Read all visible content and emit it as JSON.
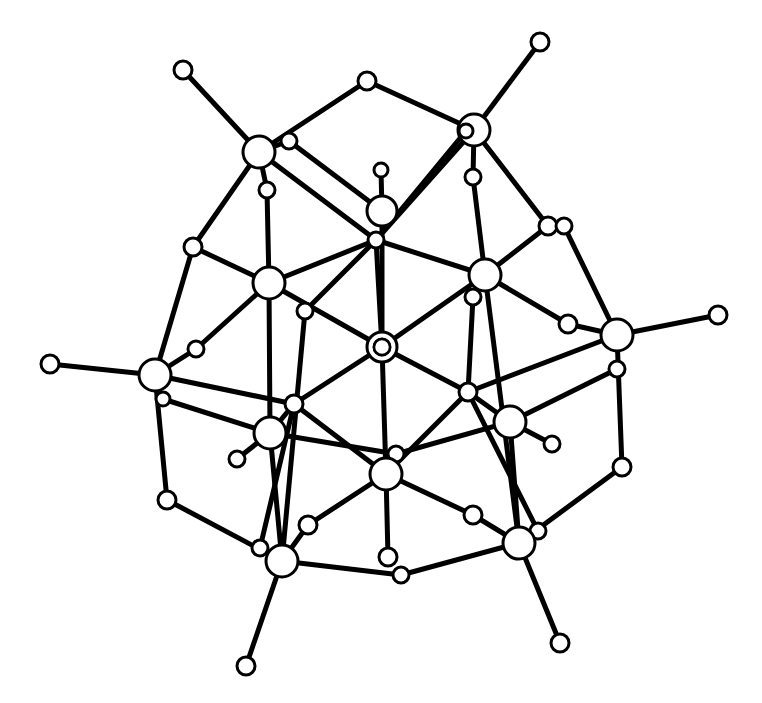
{
  "diagram": {
    "title": "",
    "type": "ball-and-stick molecular cluster",
    "colors": {
      "background": "#ffffff",
      "line": "#000000",
      "atom_fill": "#ffffff"
    },
    "atoms": [
      {
        "id": "a1",
        "x": 183,
        "y": 70,
        "r": 9
      },
      {
        "id": "a2",
        "x": 540,
        "y": 42,
        "r": 9
      },
      {
        "id": "a3",
        "x": 367,
        "y": 81,
        "r": 9
      },
      {
        "id": "a4",
        "x": 259,
        "y": 152,
        "r": 16
      },
      {
        "id": "a5",
        "x": 289,
        "y": 141,
        "r": 8
      },
      {
        "id": "a6",
        "x": 474,
        "y": 130,
        "r": 16
      },
      {
        "id": "a7",
        "x": 466,
        "y": 131,
        "r": 7
      },
      {
        "id": "a8",
        "x": 381,
        "y": 170,
        "r": 7
      },
      {
        "id": "a9",
        "x": 267,
        "y": 190,
        "r": 8
      },
      {
        "id": "a10",
        "x": 473,
        "y": 177,
        "r": 8
      },
      {
        "id": "a11",
        "x": 382,
        "y": 211,
        "r": 15
      },
      {
        "id": "a12",
        "x": 376,
        "y": 240,
        "r": 8
      },
      {
        "id": "a13",
        "x": 548,
        "y": 226,
        "r": 9
      },
      {
        "id": "a14",
        "x": 564,
        "y": 226,
        "r": 8
      },
      {
        "id": "a15",
        "x": 193,
        "y": 247,
        "r": 9
      },
      {
        "id": "a16",
        "x": 269,
        "y": 283,
        "r": 16
      },
      {
        "id": "a17",
        "x": 485,
        "y": 275,
        "r": 16
      },
      {
        "id": "a18",
        "x": 473,
        "y": 297,
        "r": 8
      },
      {
        "id": "a19",
        "x": 305,
        "y": 311,
        "r": 8
      },
      {
        "id": "a20",
        "x": 568,
        "y": 324,
        "r": 9
      },
      {
        "id": "a21",
        "x": 617,
        "y": 335,
        "r": 16
      },
      {
        "id": "a22",
        "x": 718,
        "y": 315,
        "r": 9
      },
      {
        "id": "a23",
        "x": 196,
        "y": 349,
        "r": 8
      },
      {
        "id": "a24",
        "x": 382,
        "y": 347,
        "r": 15
      },
      {
        "id": "a25",
        "x": 382,
        "y": 347,
        "r": 8
      },
      {
        "id": "a26",
        "x": 50,
        "y": 364,
        "r": 9
      },
      {
        "id": "a27",
        "x": 155,
        "y": 375,
        "r": 16
      },
      {
        "id": "a28",
        "x": 617,
        "y": 369,
        "r": 8
      },
      {
        "id": "a29",
        "x": 163,
        "y": 399,
        "r": 7
      },
      {
        "id": "a30",
        "x": 294,
        "y": 404,
        "r": 9
      },
      {
        "id": "a31",
        "x": 468,
        "y": 392,
        "r": 9
      },
      {
        "id": "a32",
        "x": 270,
        "y": 433,
        "r": 16
      },
      {
        "id": "a33",
        "x": 510,
        "y": 422,
        "r": 16
      },
      {
        "id": "a34",
        "x": 237,
        "y": 459,
        "r": 8
      },
      {
        "id": "a35",
        "x": 552,
        "y": 444,
        "r": 8
      },
      {
        "id": "a36",
        "x": 396,
        "y": 454,
        "r": 8
      },
      {
        "id": "a37",
        "x": 386,
        "y": 474,
        "r": 16
      },
      {
        "id": "a38",
        "x": 622,
        "y": 467,
        "r": 9
      },
      {
        "id": "a39",
        "x": 167,
        "y": 500,
        "r": 9
      },
      {
        "id": "a40",
        "x": 473,
        "y": 515,
        "r": 9
      },
      {
        "id": "a41",
        "x": 308,
        "y": 525,
        "r": 9
      },
      {
        "id": "a42",
        "x": 538,
        "y": 531,
        "r": 8
      },
      {
        "id": "a43",
        "x": 519,
        "y": 543,
        "r": 16
      },
      {
        "id": "a44",
        "x": 260,
        "y": 548,
        "r": 8
      },
      {
        "id": "a45",
        "x": 388,
        "y": 557,
        "r": 9
      },
      {
        "id": "a46",
        "x": 282,
        "y": 561,
        "r": 16
      },
      {
        "id": "a47",
        "x": 401,
        "y": 575,
        "r": 8
      },
      {
        "id": "a48",
        "x": 560,
        "y": 643,
        "r": 9
      },
      {
        "id": "a49",
        "x": 246,
        "y": 666,
        "r": 9
      }
    ],
    "bonds": [
      [
        "a1",
        "a4"
      ],
      [
        "a2",
        "a6"
      ],
      [
        "a3",
        "a4"
      ],
      [
        "a3",
        "a6"
      ],
      [
        "a4",
        "a9"
      ],
      [
        "a4",
        "a5"
      ],
      [
        "a5",
        "a11"
      ],
      [
        "a4",
        "a12"
      ],
      [
        "a6",
        "a10"
      ],
      [
        "a6",
        "a7"
      ],
      [
        "a7",
        "a12"
      ],
      [
        "a6",
        "a12"
      ],
      [
        "a8",
        "a11"
      ],
      [
        "a4",
        "a15"
      ],
      [
        "a6",
        "a13"
      ],
      [
        "a14",
        "a21"
      ],
      [
        "a13",
        "a17"
      ],
      [
        "a9",
        "a16"
      ],
      [
        "a10",
        "a17"
      ],
      [
        "a15",
        "a16"
      ],
      [
        "a15",
        "a27"
      ],
      [
        "a12",
        "a16"
      ],
      [
        "a12",
        "a17"
      ],
      [
        "a12",
        "a24"
      ],
      [
        "a11",
        "a24"
      ],
      [
        "a16",
        "a23"
      ],
      [
        "a23",
        "a27"
      ],
      [
        "a16",
        "a24"
      ],
      [
        "a17",
        "a24"
      ],
      [
        "a16",
        "a32"
      ],
      [
        "a12",
        "a19"
      ],
      [
        "a19",
        "a46"
      ],
      [
        "a17",
        "a20"
      ],
      [
        "a20",
        "a21"
      ],
      [
        "a21",
        "a22"
      ],
      [
        "a17",
        "a43"
      ],
      [
        "a18",
        "a31"
      ],
      [
        "a26",
        "a27"
      ],
      [
        "a27",
        "a30"
      ],
      [
        "a29",
        "a32"
      ],
      [
        "a27",
        "a39"
      ],
      [
        "a24",
        "a30"
      ],
      [
        "a24",
        "a31"
      ],
      [
        "a24",
        "a37"
      ],
      [
        "a21",
        "a31"
      ],
      [
        "a28",
        "a33"
      ],
      [
        "a21",
        "a38"
      ],
      [
        "a30",
        "a32"
      ],
      [
        "a32",
        "a34"
      ],
      [
        "a30",
        "a37"
      ],
      [
        "a31",
        "a37"
      ],
      [
        "a31",
        "a33"
      ],
      [
        "a33",
        "a35"
      ],
      [
        "a32",
        "a36"
      ],
      [
        "a33",
        "a36"
      ],
      [
        "a30",
        "a44"
      ],
      [
        "a31",
        "a42"
      ],
      [
        "a37",
        "a41"
      ],
      [
        "a37",
        "a40"
      ],
      [
        "a37",
        "a45"
      ],
      [
        "a41",
        "a46"
      ],
      [
        "a40",
        "a43"
      ],
      [
        "a38",
        "a43"
      ],
      [
        "a39",
        "a46"
      ],
      [
        "a46",
        "a47"
      ],
      [
        "a43",
        "a47"
      ],
      [
        "a46",
        "a49"
      ],
      [
        "a43",
        "a48"
      ],
      [
        "a32",
        "a46"
      ],
      [
        "a33",
        "a43"
      ]
    ],
    "inner_rings": [
      {
        "atom": "a24",
        "r": 8
      }
    ]
  }
}
